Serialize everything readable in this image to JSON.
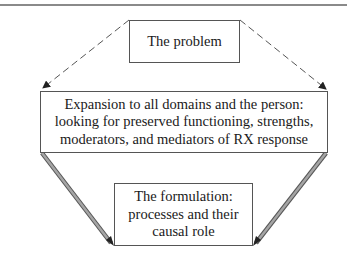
{
  "diagram": {
    "nodes": [
      {
        "id": "problem",
        "label": "The problem"
      },
      {
        "id": "expansion",
        "label": "Expansion to all domains and the person:\nlooking for preserved functioning, strengths,\nmoderators, and mediators of RX response"
      },
      {
        "id": "formulation",
        "label": "The formulation:\nprocesses and their\ncausal role"
      }
    ],
    "edges": [
      {
        "from": "problem",
        "to": "expansion",
        "side": "left",
        "style": "dashed"
      },
      {
        "from": "problem",
        "to": "expansion",
        "side": "right",
        "style": "dashed"
      },
      {
        "from": "expansion",
        "to": "formulation",
        "side": "left",
        "style": "double-shaft"
      },
      {
        "from": "expansion",
        "to": "formulation",
        "side": "right",
        "style": "double-shaft"
      }
    ],
    "colors": {
      "line": "#555555",
      "shaft_fill": "#9a9a9a",
      "rule": "#8a8a8a"
    }
  }
}
